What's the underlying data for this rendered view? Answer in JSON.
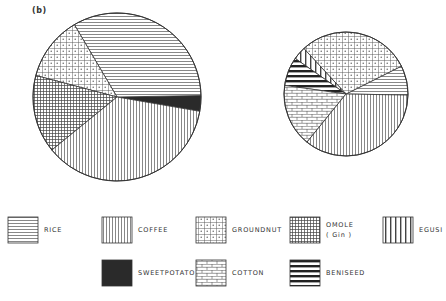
{
  "figure": {
    "panel_label": "(b)"
  },
  "chart_data": [
    {
      "type": "pie",
      "title": "",
      "panel": "(b) left (large pie)",
      "categories": [
        "SWEETPOTATO",
        "RICE",
        "GROUNDNUT",
        "OMOLE (Gin)",
        "COFFEE"
      ],
      "values": [
        3.0,
        33.2,
        12.4,
        15.0,
        36.4
      ],
      "start_angle_deg": -9.8,
      "direction": "counterclockwise",
      "center": [
        117,
        97
      ],
      "radius": 84
    },
    {
      "type": "pie",
      "title": "",
      "panel": "(b) right (small pie)",
      "categories": [
        "RICE",
        "GROUNDNUT",
        "EGUSI",
        "BENISEED",
        "COTTON",
        "COFFEE"
      ],
      "values": [
        7.7,
        29.5,
        3.4,
        7.5,
        16.4,
        35.6
      ],
      "start_angle_deg": -1,
      "direction": "counterclockwise",
      "center": [
        346,
        94
      ],
      "radius": 62
    }
  ],
  "legend": {
    "items": [
      {
        "key": "RICE",
        "label": "RICE",
        "pattern": "horizontal-lines",
        "x": 8,
        "y": 217
      },
      {
        "key": "COFFEE",
        "label": "COFFEE",
        "pattern": "vertical-lines",
        "x": 102,
        "y": 217
      },
      {
        "key": "GROUNDNUT",
        "label": "GROUNDNUT",
        "pattern": "dotted-grid",
        "x": 196,
        "y": 217
      },
      {
        "key": "OMOLE (Gin)",
        "label": "OMOLE\n( Gin )",
        "pattern": "fine-crosshatch",
        "x": 290,
        "y": 217
      },
      {
        "key": "EGUSI",
        "label": "EGUSI",
        "pattern": "wide-vertical-lines",
        "x": 383,
        "y": 217
      },
      {
        "key": "SWEETPOTATO",
        "label": "SWEETPOTATO",
        "pattern": "solid-dark",
        "x": 102,
        "y": 260
      },
      {
        "key": "COTTON",
        "label": "COTTON",
        "pattern": "brick",
        "x": 196,
        "y": 260
      },
      {
        "key": "BENISEED",
        "label": "BENISEED",
        "pattern": "thick-horizontal-bars",
        "x": 290,
        "y": 260
      }
    ]
  },
  "colors": {
    "ink": "#333333",
    "line": "#555555",
    "dark": "#2a2a2a",
    "background": "#ffffff"
  }
}
